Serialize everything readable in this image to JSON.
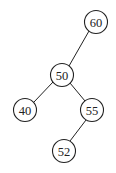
{
  "diagram": {
    "type": "binary-search-tree",
    "nodes": [
      {
        "id": "n60",
        "label": "60",
        "cx": 96,
        "cy": 22
      },
      {
        "id": "n50",
        "label": "50",
        "cx": 62,
        "cy": 75
      },
      {
        "id": "n40",
        "label": "40",
        "cx": 25,
        "cy": 110
      },
      {
        "id": "n55",
        "label": "55",
        "cx": 92,
        "cy": 110
      },
      {
        "id": "n52",
        "label": "52",
        "cx": 64,
        "cy": 151
      }
    ],
    "edges": [
      {
        "from": "60",
        "to": "50"
      },
      {
        "from": "50",
        "to": "40"
      },
      {
        "from": "50",
        "to": "55"
      },
      {
        "from": "55",
        "to": "52"
      }
    ],
    "node_radius": 11.5,
    "colors": {
      "stroke": "#222222",
      "fill": "#ffffff",
      "text": "#222222"
    }
  }
}
